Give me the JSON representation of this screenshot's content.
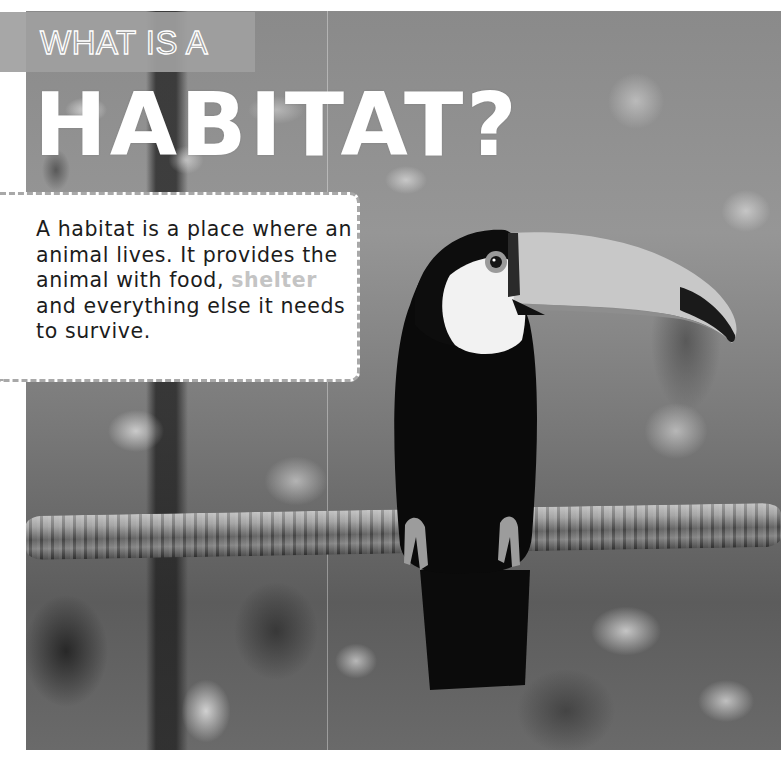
{
  "header": {
    "kicker": "WHAT IS A",
    "title": "HABITAT?"
  },
  "definition": {
    "text_before": "A habitat is a place where an animal lives. It provides the animal with food, ",
    "highlight": "shelter",
    "text_after": " and everything else it needs to survive."
  },
  "photo": {
    "subject": "toucan perched on a branch in a forest",
    "icon": "toucan-icon"
  },
  "colors": {
    "header_band": "#a0a0a0",
    "title_text": "#ffffff",
    "body_text": "#1c1c1c",
    "highlight_text": "#c4c4c4",
    "box_border": "#a8a8a8"
  }
}
